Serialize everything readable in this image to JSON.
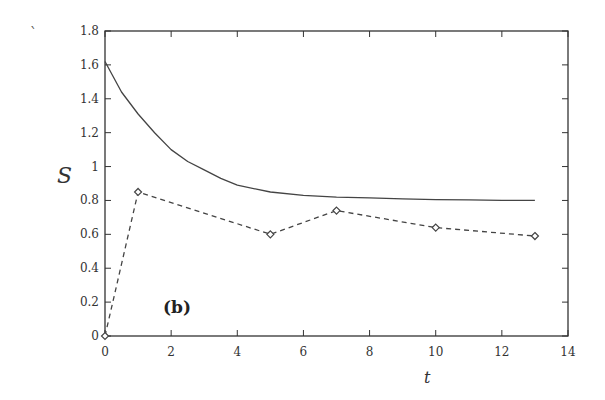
{
  "chart_data": {
    "type": "line",
    "title": "",
    "panel_label": "(b)",
    "xlabel": "t",
    "ylabel": "S",
    "xlim": [
      0,
      14
    ],
    "ylim": [
      0,
      1.8
    ],
    "xticks": [
      0,
      2,
      4,
      6,
      8,
      10,
      12,
      14
    ],
    "yticks": [
      0,
      0.2,
      0.4,
      0.6,
      0.8,
      1,
      1.2,
      1.4,
      1.6,
      1.8
    ],
    "xtick_labels": [
      "0",
      "2",
      "4",
      "6",
      "8",
      "10",
      "12",
      "14"
    ],
    "ytick_labels": [
      "0",
      "0.2",
      "0.4",
      "0.6",
      "0.8",
      "1",
      "1.2",
      "1.4",
      "1.6",
      "1.8"
    ],
    "grid": false,
    "legend": null,
    "series": [
      {
        "name": "solid curve",
        "style": "solid",
        "marker": "none",
        "x": [
          0,
          0.5,
          1,
          1.5,
          2,
          2.5,
          3,
          3.5,
          4,
          5,
          6,
          7,
          8,
          9,
          10,
          11,
          12,
          13
        ],
        "y": [
          1.62,
          1.44,
          1.31,
          1.2,
          1.1,
          1.03,
          0.98,
          0.93,
          0.89,
          0.85,
          0.83,
          0.82,
          0.815,
          0.81,
          0.805,
          0.803,
          0.801,
          0.8
        ]
      },
      {
        "name": "dashed with diamonds",
        "style": "dashed",
        "marker": "diamond",
        "x": [
          0,
          1,
          5,
          7,
          10,
          13
        ],
        "y": [
          0,
          0.85,
          0.6,
          0.74,
          0.64,
          0.59
        ]
      }
    ]
  },
  "colors": {
    "axis": "#333333",
    "line": "#444444"
  }
}
